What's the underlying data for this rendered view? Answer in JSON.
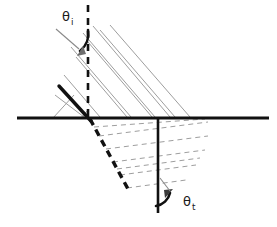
{
  "figure": {
    "width": 277,
    "height": 227,
    "background_color": "#ffffff"
  },
  "colors": {
    "ray_color": "#111111",
    "interface_color": "#111111",
    "hatch_color": "#9a9a9a",
    "label_color": "#1a1a1a",
    "arrow_color": "#111111"
  },
  "labels": {
    "theta_incident": {
      "symbol": "θ",
      "subscript": "i",
      "x": 62,
      "y": 20
    },
    "theta_transmitted": {
      "symbol": "θ",
      "subscript": "t",
      "x": 183,
      "y": 205
    }
  },
  "elements": {
    "interface_line": {
      "name": "interface-boundary",
      "x1": 17,
      "y1": 118,
      "x2": 269,
      "y2": 118,
      "stroke_width": 3,
      "style": "solid"
    },
    "normal_above": {
      "name": "normal-dashed-upper",
      "x1": 88,
      "y1": 5,
      "x2": 88,
      "y2": 119,
      "stroke_width": 2.6,
      "style": "dashed"
    },
    "normal_below": {
      "name": "normal-solid-lower",
      "x1": 158,
      "y1": 118,
      "x2": 158,
      "y2": 213,
      "stroke_width": 2.6,
      "style": "solid"
    },
    "incident_ray": {
      "name": "incident-ray",
      "x1": 59,
      "y1": 86,
      "x2": 90,
      "y2": 120,
      "stroke_width": 3.2,
      "style": "solid"
    },
    "transmitted_ray": {
      "name": "transmitted-ray",
      "x1": 90,
      "y1": 119,
      "x2": 128,
      "y2": 189,
      "stroke_width": 3.2,
      "style": "dashed"
    },
    "incident_beam_hatch": {
      "name": "incident-beam-hatching",
      "style": "solid",
      "stroke_width": 1.0,
      "count": 9,
      "direction": "parallel-to-incident-ray"
    },
    "transmitted_beam_hatch": {
      "name": "transmitted-beam-hatching",
      "style": "dashed",
      "stroke_width": 1.0,
      "count": 7,
      "direction": "parallel-to-transmitted-ray"
    },
    "angle_arc_incident": {
      "name": "angle-arc-incident",
      "description": "curved arrow from incident ray to normal"
    },
    "angle_arc_transmitted": {
      "name": "angle-arc-transmitted",
      "description": "curved arrow from normal to transmitted ray"
    }
  }
}
